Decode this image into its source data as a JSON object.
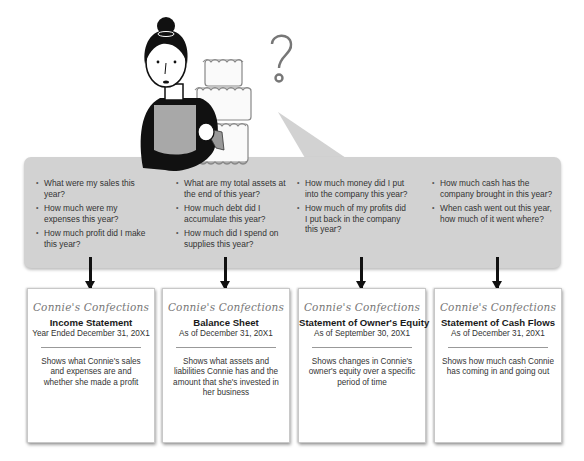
{
  "illustration": {
    "character": "Connie holding a piping bag next to a three-tier cake",
    "thought_symbol": "?"
  },
  "colors": {
    "panel_gray": "#d2d2d2",
    "arrow": "#111111",
    "card_bg": "#ffffff",
    "hair": "#111111",
    "apron": "#a8a8a8"
  },
  "question_columns": [
    {
      "questions": [
        "What were my sales this year?",
        "How much were my expenses this year?",
        "How much profit did I make this year?"
      ]
    },
    {
      "questions": [
        "What are my total assets at the end of this year?",
        "How much debt did I accumulate this year?",
        "How much did I spend on supplies this year?"
      ]
    },
    {
      "questions": [
        "How much money did I put into the company this year?",
        "How much of my profits did I put back in the company this year?"
      ]
    },
    {
      "questions": [
        "How much cash has the company brought in this year?",
        "When cash went out this year, how much of it went where?"
      ]
    }
  ],
  "statements": [
    {
      "company": "Connie's Confections",
      "title": "Income Statement",
      "period": "Year Ended December 31, 20X1",
      "description": "Shows what Connie's sales and expenses are and whether she made a profit"
    },
    {
      "company": "Connie's Confections",
      "title": "Balance Sheet",
      "period": "As of December 31, 20X1",
      "description": "Shows what assets and liabilities Connie has and the amount that she's invested in her business"
    },
    {
      "company": "Connie's Confections",
      "title": "Statement of Owner's Equity",
      "period": "As of September 30, 20X1",
      "description": "Shows changes in Connie's owner's equity over a specific period of time"
    },
    {
      "company": "Connie's Confections",
      "title": "Statement of Cash Flows",
      "period": "As of December 31, 20X1",
      "description": "Shows how much cash Connie has coming in and going out"
    }
  ]
}
